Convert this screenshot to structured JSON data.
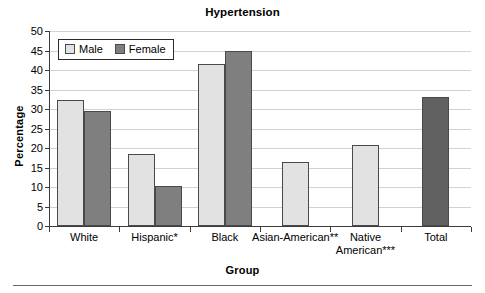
{
  "chart_data": {
    "type": "bar",
    "title": "Hypertension",
    "xlabel": "Group",
    "ylabel": "Percentage",
    "categories": [
      "White",
      "Hispanic*",
      "Black",
      "Asian-American**",
      "Native American***",
      "Total"
    ],
    "category_label_lines": [
      [
        "White"
      ],
      [
        "Hispanic*"
      ],
      [
        "Black"
      ],
      [
        "Asian-American**"
      ],
      [
        "Native",
        "American***"
      ],
      [
        "Total"
      ]
    ],
    "series": [
      {
        "name": "Male",
        "values": [
          32.3,
          18.5,
          41.6,
          16.5,
          20.8,
          null
        ]
      },
      {
        "name": "Female",
        "values": [
          29.5,
          10.3,
          44.8,
          null,
          null,
          null
        ]
      },
      {
        "name": "Total",
        "values": [
          null,
          null,
          null,
          null,
          null,
          33.0
        ]
      }
    ],
    "ylim": [
      0,
      50
    ],
    "yticks": [
      0,
      5,
      10,
      15,
      20,
      25,
      30,
      35,
      40,
      45,
      50
    ],
    "ytick_labels": [
      "0",
      "5",
      "10",
      "15",
      "20",
      "25",
      "30",
      "35",
      "40",
      "45",
      "50"
    ],
    "grid": true,
    "legend": {
      "position": "top-left",
      "entries": [
        "Male",
        "Female"
      ]
    },
    "colors": {
      "male": "#e2e2e2",
      "female": "#7f7f7f",
      "total": "#616161",
      "bar_outline": "#4a4a4a",
      "axis": "#3c3c3c",
      "gridline": "#d2d2d2",
      "background": "#ffffff",
      "text": "#000000"
    }
  }
}
